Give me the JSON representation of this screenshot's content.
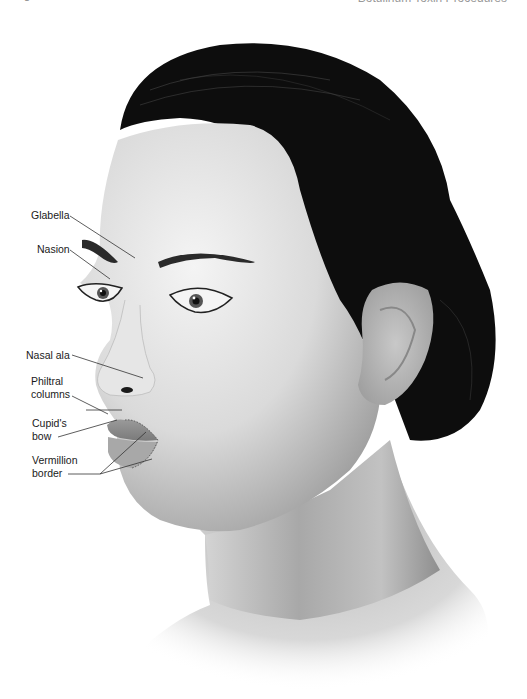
{
  "header": {
    "page_number": "8",
    "running_head": "Botulinum Toxin Procedures"
  },
  "figure": {
    "labels": [
      {
        "id": "glabella",
        "text": "Glabella"
      },
      {
        "id": "nasion",
        "text": "Nasion"
      },
      {
        "id": "nasal-ala",
        "text": "Nasal ala"
      },
      {
        "id": "philtral-columns-1",
        "text": "Philtral"
      },
      {
        "id": "philtral-columns-2",
        "text": "columns"
      },
      {
        "id": "cupids-bow-1",
        "text": "Cupid's"
      },
      {
        "id": "cupids-bow-2",
        "text": "bow"
      },
      {
        "id": "vermillion-border-1",
        "text": "Vermillion"
      },
      {
        "id": "vermillion-border-2",
        "text": "border"
      }
    ],
    "colors": {
      "hair": "#0d0d0d",
      "skin_light": "#f0f0f0",
      "skin_shadow": "#9a9a9a",
      "leader_line": "#333333"
    }
  }
}
